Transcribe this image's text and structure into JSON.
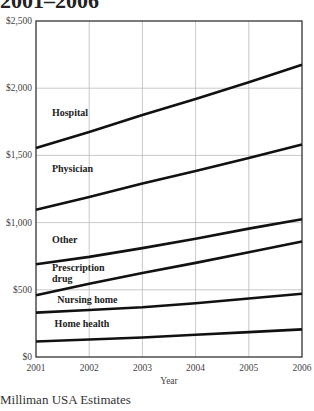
{
  "header": {
    "title_fragment": "2001–2006"
  },
  "footer": {
    "source": "Milliman USA Estimates"
  },
  "chart_data": {
    "type": "line",
    "title": "2001–2006",
    "xlabel": "Year",
    "ylabel": "",
    "x": [
      2001,
      2002,
      2003,
      2004,
      2005,
      2006
    ],
    "x_tick_labels": [
      "2001",
      "2002",
      "2003",
      "2004",
      "2005",
      "2006"
    ],
    "ylim": [
      0,
      2500
    ],
    "y_ticks": [
      0,
      500,
      1000,
      1500,
      2000,
      2500
    ],
    "y_tick_labels": [
      "$0",
      "$500",
      "$1,000",
      "$1,500",
      "$2,000",
      "$2,500"
    ],
    "grid": true,
    "legend": "inline labels",
    "series": [
      {
        "name": "Hospital",
        "values": [
          1555,
          1675,
          1800,
          1920,
          2045,
          2175
        ],
        "label_x": 2001.3,
        "label_y": 1795
      },
      {
        "name": "Physician",
        "values": [
          1095,
          1190,
          1290,
          1385,
          1480,
          1580
        ],
        "label_x": 2001.3,
        "label_y": 1375
      },
      {
        "name": "Other",
        "values": [
          690,
          745,
          810,
          880,
          955,
          1025
        ],
        "label_x": 2001.3,
        "label_y": 850
      },
      {
        "name": "Prescription drug",
        "label_lines": [
          "Prescription",
          "drug"
        ],
        "values": [
          460,
          545,
          625,
          700,
          780,
          860
        ],
        "label_x": 2001.3,
        "label_y": 640
      },
      {
        "name": "Nursing home",
        "values": [
          330,
          350,
          370,
          400,
          435,
          470
        ],
        "label_x": 2001.4,
        "label_y": 400
      },
      {
        "name": "Home health",
        "values": [
          115,
          130,
          145,
          165,
          185,
          205
        ],
        "label_x": 2001.35,
        "label_y": 225
      }
    ]
  }
}
